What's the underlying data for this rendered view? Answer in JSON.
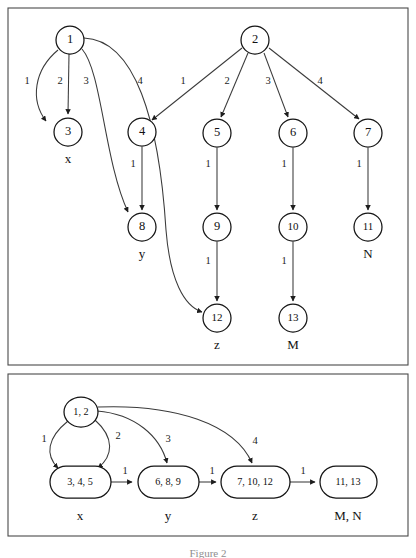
{
  "figure": {
    "caption": "Figure 2",
    "panels": [
      {
        "id": "top-panel",
        "name": "original-trie-graph",
        "description": "Trie-like digraph with numbered states and numeric edge labels"
      },
      {
        "id": "bottom-panel",
        "name": "merged-state-graph",
        "description": "Reduced graph with merged equivalent states"
      }
    ]
  },
  "top_panel": {
    "nodes": [
      {
        "id": "n1",
        "label": "1",
        "cx": 70,
        "cy": 40,
        "r": 14
      },
      {
        "id": "n2",
        "label": "2",
        "cx": 255,
        "cy": 40,
        "r": 14
      },
      {
        "id": "n3",
        "label": "3",
        "cx": 68,
        "cy": 132,
        "r": 14
      },
      {
        "id": "n4",
        "label": "4",
        "cx": 142,
        "cy": 132,
        "r": 14
      },
      {
        "id": "n5",
        "label": "5",
        "cx": 217,
        "cy": 133,
        "r": 14
      },
      {
        "id": "n6",
        "label": "6",
        "cx": 293,
        "cy": 133,
        "r": 14
      },
      {
        "id": "n7",
        "label": "7",
        "cx": 368,
        "cy": 133,
        "r": 14
      },
      {
        "id": "n8",
        "label": "8",
        "cx": 142,
        "cy": 227,
        "r": 14
      },
      {
        "id": "n9",
        "label": "9",
        "cx": 217,
        "cy": 227,
        "r": 14
      },
      {
        "id": "n10",
        "label": "10",
        "cx": 293,
        "cy": 227,
        "r": 14
      },
      {
        "id": "n11",
        "label": "11",
        "cx": 368,
        "cy": 227,
        "r": 14
      },
      {
        "id": "n12",
        "label": "12",
        "cx": 217,
        "cy": 318,
        "r": 14
      },
      {
        "id": "n13",
        "label": "13",
        "cx": 293,
        "cy": 318,
        "r": 14
      }
    ],
    "terminal_labels": [
      {
        "id": "t-x",
        "text": "x",
        "x": 68,
        "y": 160
      },
      {
        "id": "t-y",
        "text": "y",
        "x": 142,
        "y": 255
      },
      {
        "id": "t-z",
        "text": "z",
        "x": 217,
        "y": 346
      },
      {
        "id": "t-M",
        "text": "M",
        "x": 293,
        "y": 346
      },
      {
        "id": "t-N",
        "text": "N",
        "x": 368,
        "y": 255
      }
    ],
    "edges": [
      {
        "id": "e1-3a",
        "from": "1",
        "to": "3",
        "label": "1",
        "lx": 27,
        "ly": 82
      },
      {
        "id": "e1-3b",
        "from": "1",
        "to": "3",
        "label": "2",
        "lx": 60,
        "ly": 82
      },
      {
        "id": "e1-8",
        "from": "1",
        "to": "8",
        "label": "3",
        "lx": 86,
        "ly": 82
      },
      {
        "id": "e1-12",
        "from": "1",
        "to": "12",
        "label": "4",
        "lx": 140,
        "ly": 82
      },
      {
        "id": "e2-4",
        "from": "2",
        "to": "4",
        "label": "1",
        "lx": 183,
        "ly": 82
      },
      {
        "id": "e2-5",
        "from": "2",
        "to": "5",
        "label": "2",
        "lx": 227,
        "ly": 82
      },
      {
        "id": "e2-6",
        "from": "2",
        "to": "6",
        "label": "3",
        "lx": 268,
        "ly": 82
      },
      {
        "id": "e2-7",
        "from": "2",
        "to": "7",
        "label": "4",
        "lx": 320,
        "ly": 82
      },
      {
        "id": "e4-8",
        "from": "4",
        "to": "8",
        "label": "1",
        "lx": 133,
        "ly": 165
      },
      {
        "id": "e5-9",
        "from": "5",
        "to": "9",
        "label": "1",
        "lx": 208,
        "ly": 165
      },
      {
        "id": "e6-10",
        "from": "6",
        "to": "10",
        "label": "1",
        "lx": 284,
        "ly": 165
      },
      {
        "id": "e7-11",
        "from": "7",
        "to": "11",
        "label": "1",
        "lx": 359,
        "ly": 165
      },
      {
        "id": "e9-12",
        "from": "9",
        "to": "12",
        "label": "1",
        "lx": 208,
        "ly": 262
      },
      {
        "id": "e10-13",
        "from": "10",
        "to": "13",
        "label": "1",
        "lx": 284,
        "ly": 262
      }
    ]
  },
  "bottom_panel": {
    "nodes": [
      {
        "id": "m12",
        "label": "1, 2",
        "cx": 81,
        "cy": 412,
        "rx": 17,
        "ry": 15
      },
      {
        "id": "m345",
        "label": "3, 4, 5",
        "cx": 80,
        "cy": 482,
        "rx": 30,
        "ry": 16
      },
      {
        "id": "m689",
        "label": "6, 8, 9",
        "cx": 168,
        "cy": 482,
        "rx": 30,
        "ry": 16
      },
      {
        "id": "m71012",
        "label": "7, 10, 12",
        "cx": 255,
        "cy": 482,
        "rx": 34,
        "ry": 16
      },
      {
        "id": "m1113",
        "label": "11, 13",
        "cx": 348,
        "cy": 482,
        "rx": 28,
        "ry": 16
      }
    ],
    "terminal_labels": [
      {
        "id": "bt-x",
        "text": "x",
        "x": 80,
        "y": 517
      },
      {
        "id": "bt-y",
        "text": "y",
        "x": 168,
        "y": 517
      },
      {
        "id": "bt-z",
        "text": "z",
        "x": 255,
        "y": 517
      },
      {
        "id": "bt-MN",
        "text": "M, N",
        "x": 348,
        "y": 517
      }
    ],
    "edges": [
      {
        "id": "be1",
        "from": "1, 2",
        "to": "3, 4, 5",
        "label": "1",
        "lx": 44,
        "ly": 440
      },
      {
        "id": "be2",
        "from": "1, 2",
        "to": "3, 4, 5",
        "label": "2",
        "lx": 118,
        "ly": 437
      },
      {
        "id": "be3",
        "from": "1, 2",
        "to": "6, 8, 9",
        "label": "3",
        "lx": 168,
        "ly": 440
      },
      {
        "id": "be4",
        "from": "1, 2",
        "to": "7, 10, 12",
        "label": "4",
        "lx": 255,
        "ly": 442
      },
      {
        "id": "be5",
        "from": "3, 4, 5",
        "to": "6, 8, 9",
        "label": "1",
        "lx": 125,
        "ly": 472
      },
      {
        "id": "be6",
        "from": "6, 8, 9",
        "to": "7, 10, 12",
        "label": "1",
        "lx": 212,
        "ly": 472
      },
      {
        "id": "be7",
        "from": "7, 10, 12",
        "to": "11, 13",
        "label": "1",
        "lx": 303,
        "ly": 472
      }
    ]
  },
  "colors": {
    "frame": "#4a4a4a",
    "node_stroke": "#141414",
    "edge_stroke": "#3a3a3a",
    "text": "#111111",
    "background": "#ffffff"
  }
}
